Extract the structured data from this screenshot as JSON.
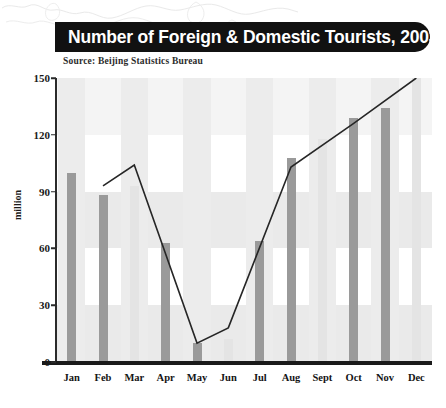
{
  "title": "Number of Foreign & Domestic Tourists, 2003",
  "source": "Source: Beijing Statistics Bureau",
  "axis": {
    "ylabel": "million",
    "yticks": [
      "0",
      "30",
      "60",
      "90",
      "120",
      "150"
    ]
  },
  "colors": {
    "title_bar": "#111111",
    "title_text": "#ffffff",
    "bar_dark": "#9a9a9a",
    "bar_light": "#e4e4e4",
    "band": "#eaeaea",
    "line": "#262626",
    "axis": "#1a1a1a"
  },
  "chart_data": {
    "type": "bar",
    "title": "Number of Foreign & Domestic Tourists, 2003",
    "subtitle": "Source: Beijing Statistics Bureau",
    "xlabel": "",
    "ylabel": "million",
    "ylim": [
      0,
      150
    ],
    "yticks": [
      0,
      30,
      60,
      90,
      120,
      150
    ],
    "grid": true,
    "legend": false,
    "categories": [
      "Jan",
      "Feb",
      "Mar",
      "Apr",
      "May",
      "Jun",
      "Jul",
      "Aug",
      "Sept",
      "Oct",
      "Nov",
      "Dec"
    ],
    "series": [
      {
        "name": "Monthly tourists",
        "type": "bar",
        "values": [
          100,
          88,
          93,
          63,
          10,
          12,
          64,
          108,
          118,
          129,
          134,
          150
        ],
        "bar_style": [
          "dark",
          "dark",
          "light",
          "dark",
          "dark",
          "light",
          "dark",
          "dark",
          "light",
          "dark",
          "dark",
          "light"
        ]
      },
      {
        "name": "Cumulative trend",
        "type": "line",
        "values": [
          null,
          93,
          104,
          null,
          10,
          18,
          null,
          103,
          null,
          126,
          null,
          150
        ]
      }
    ]
  }
}
